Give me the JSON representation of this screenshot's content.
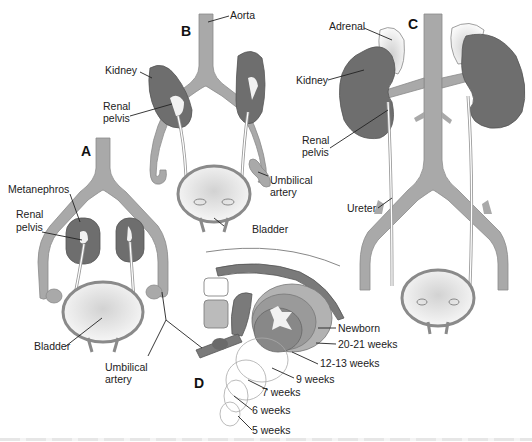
{
  "figure": {
    "panels": {
      "A": "A",
      "B": "B",
      "C": "C",
      "D": "D"
    },
    "labels": {
      "aorta": "Aorta",
      "kidney_b": "Kidney",
      "renal_pelvis_b_1": "Renal",
      "renal_pelvis_b_2": "pelvis",
      "umbilical_artery_b_1": "Umbilical",
      "umbilical_artery_b_2": "artery",
      "bladder_b": "Bladder",
      "metanephros": "Metanephros",
      "renal_pelvis_a_1": "Renal",
      "renal_pelvis_a_2": "pelvis",
      "bladder_a": "Bladder",
      "umbilical_artery_a_1": "Umbilical",
      "umbilical_artery_a_2": "artery",
      "adrenal": "Adrenal",
      "kidney_c": "Kidney",
      "renal_pelvis_c_1": "Renal",
      "renal_pelvis_c_2": "pelvis",
      "ureter": "Ureter"
    },
    "stages": [
      "Newborn",
      "20-21 weeks",
      "12-13 weeks",
      "9 weeks",
      "7 weeks",
      "6 weeks",
      "5 weeks"
    ],
    "colors": {
      "vessel": "#a9a9a9",
      "vessel_edge": "#8a8a8a",
      "kidney": "#6e6e6e",
      "kidney_edge": "#555555",
      "bladder_fill": "#e4e4e4",
      "adrenal": "#ececec",
      "leader": "#222222"
    }
  }
}
